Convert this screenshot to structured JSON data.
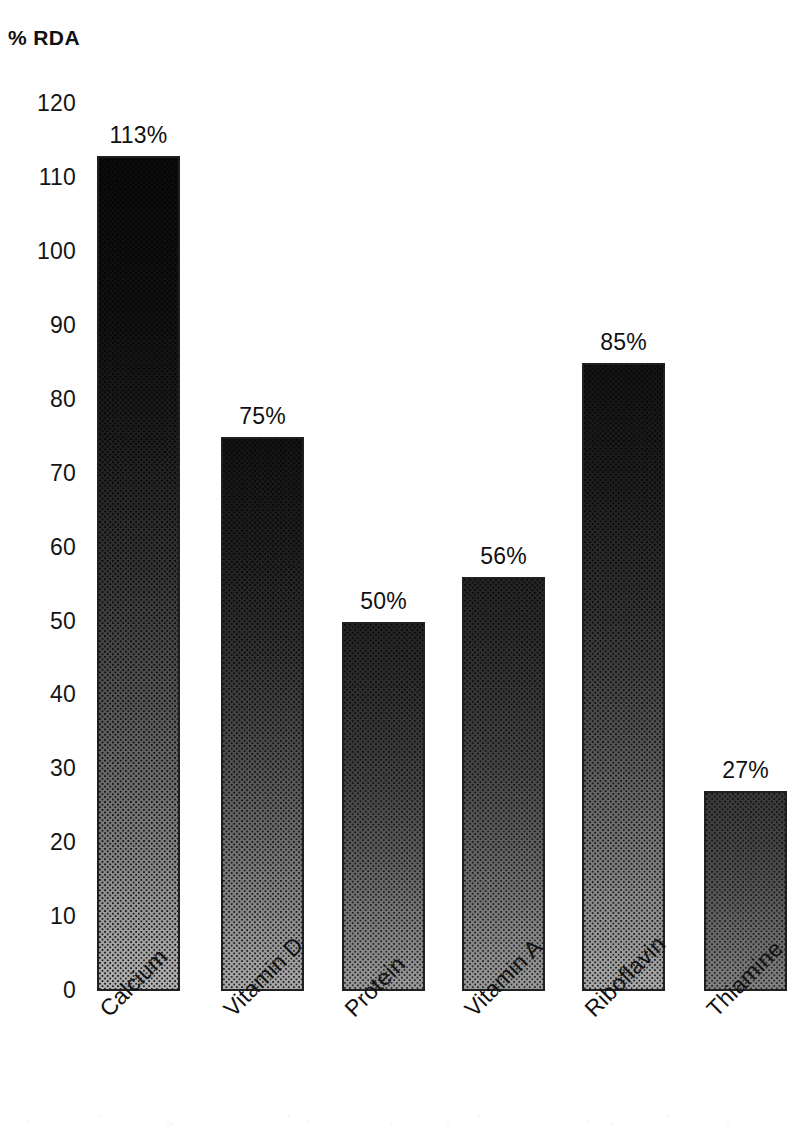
{
  "chart_data": {
    "type": "bar",
    "title": "% RDA",
    "xlabel": "",
    "ylabel": "% RDA",
    "ylim": [
      0,
      120
    ],
    "ytick_step": 10,
    "yticks": [
      120,
      110,
      100,
      90,
      80,
      70,
      60,
      50,
      40,
      30,
      20,
      10,
      0
    ],
    "grid": false,
    "legend": false,
    "legend_position": "none",
    "categories": [
      "Calcium",
      "Vitamin D",
      "Protein",
      "Vitamin A",
      "Riboflavin",
      "Thiamine"
    ],
    "values": [
      113,
      75,
      50,
      56,
      85,
      27
    ],
    "data_labels": [
      "113%",
      "75%",
      "50%",
      "56%",
      "85%",
      "27%"
    ],
    "bars": [
      {
        "category": "Calcium",
        "value": 113,
        "label": "113%",
        "tone": "tone-xdark"
      },
      {
        "category": "Vitamin D",
        "value": 75,
        "label": "75%",
        "tone": "tone-dark"
      },
      {
        "category": "Protein",
        "value": 50,
        "label": "50%",
        "tone": "tone-mid"
      },
      {
        "category": "Vitamin A",
        "value": 56,
        "label": "56%",
        "tone": "tone-mid"
      },
      {
        "category": "Riboflavin",
        "value": 85,
        "label": "85%",
        "tone": "tone-dark"
      },
      {
        "category": "Thiamine",
        "value": 27,
        "label": "27%",
        "tone": "tone-light"
      }
    ],
    "colors": {
      "background": "#ffffff",
      "text": "#111111",
      "bar_border": "#202020",
      "bar_top": "#0e0e0e",
      "bar_bottom": "#b4b4b4"
    }
  }
}
